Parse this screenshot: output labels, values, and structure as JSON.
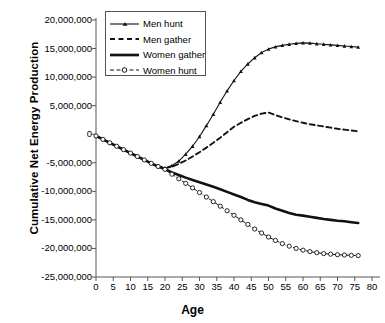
{
  "chart_data": {
    "type": "line",
    "title": "",
    "xlabel": "Age",
    "ylabel": "Cumulative Net Energy Production",
    "xlim": [
      0,
      80
    ],
    "ylim": [
      -25000000,
      20000000
    ],
    "xticks": [
      0,
      5,
      10,
      15,
      20,
      25,
      30,
      35,
      40,
      45,
      50,
      55,
      60,
      65,
      70,
      75,
      80
    ],
    "xtick_labels": [
      "0",
      "5",
      "10",
      "15",
      "20",
      "25",
      "30",
      "35",
      "40",
      "45",
      "50",
      "55",
      "60",
      "65",
      "70",
      "75",
      "80"
    ],
    "yticks": [
      20000000,
      15000000,
      10000000,
      5000000,
      0,
      -5000000,
      -10000000,
      -15000000,
      -20000000,
      -25000000
    ],
    "ytick_labels": [
      "20,000,000",
      "15,000,000",
      "10,000,000",
      "5,000,000",
      "0",
      "-5,000,000",
      "-10,000,000",
      "-15,000,000",
      "-20,000,000",
      "-25,000,000"
    ],
    "grid": false,
    "legend_position": "top-center",
    "x": [
      0,
      2,
      4,
      6,
      8,
      10,
      12,
      14,
      16,
      18,
      20,
      22,
      24,
      26,
      28,
      30,
      32,
      34,
      36,
      38,
      40,
      42,
      44,
      46,
      48,
      50,
      52,
      54,
      56,
      58,
      60,
      62,
      64,
      66,
      68,
      70,
      72,
      74,
      76
    ],
    "series": [
      {
        "name": "Men hunt",
        "marker": "triangle",
        "linestyle": "solid-thin-with-markers",
        "values": [
          -300000,
          -900000,
          -1500000,
          -2100000,
          -2700000,
          -3300000,
          -3900000,
          -4500000,
          -5100000,
          -5600000,
          -5900000,
          -5500000,
          -4700000,
          -3500000,
          -2100000,
          -400000,
          1500000,
          3500000,
          5600000,
          7600000,
          9400000,
          11000000,
          12300000,
          13400000,
          14300000,
          14900000,
          15300000,
          15550000,
          15750000,
          15900000,
          16000000,
          15950000,
          15850000,
          15750000,
          15650000,
          15550000,
          15450000,
          15350000,
          15250000
        ]
      },
      {
        "name": "Men gather",
        "marker": "none",
        "linestyle": "dashed",
        "values": [
          -300000,
          -900000,
          -1500000,
          -2100000,
          -2700000,
          -3300000,
          -3900000,
          -4500000,
          -5100000,
          -5600000,
          -5950000,
          -5700000,
          -5200000,
          -4600000,
          -3900000,
          -3150000,
          -2350000,
          -1500000,
          -600000,
          350000,
          1300000,
          2000000,
          2650000,
          3200000,
          3600000,
          3800000,
          3350000,
          2950000,
          2600000,
          2300000,
          2000000,
          1750000,
          1550000,
          1350000,
          1150000,
          950000,
          800000,
          650000,
          500000
        ]
      },
      {
        "name": "Women gather",
        "marker": "none",
        "linestyle": "solid-thick",
        "values": [
          -300000,
          -900000,
          -1500000,
          -2100000,
          -2700000,
          -3300000,
          -3900000,
          -4500000,
          -5100000,
          -5650000,
          -6100000,
          -6700000,
          -7150000,
          -7600000,
          -8000000,
          -8400000,
          -8800000,
          -9200000,
          -9650000,
          -10100000,
          -10550000,
          -11000000,
          -11500000,
          -11900000,
          -12200000,
          -12500000,
          -13000000,
          -13400000,
          -13800000,
          -14100000,
          -14250000,
          -14450000,
          -14650000,
          -14850000,
          -15000000,
          -15150000,
          -15250000,
          -15400000,
          -15550000
        ]
      },
      {
        "name": "Women hunt",
        "marker": "circle",
        "linestyle": "dash-dot-with-markers",
        "values": [
          -300000,
          -900000,
          -1500000,
          -2100000,
          -2700000,
          -3300000,
          -3900000,
          -4500000,
          -5100000,
          -5650000,
          -6150000,
          -7000000,
          -7800000,
          -8600000,
          -9400000,
          -10200000,
          -11000000,
          -11800000,
          -12600000,
          -13400000,
          -14200000,
          -15000000,
          -15800000,
          -16600000,
          -17300000,
          -18000000,
          -18600000,
          -19150000,
          -19600000,
          -20000000,
          -20300000,
          -20550000,
          -20750000,
          -20900000,
          -21000000,
          -21100000,
          -21150000,
          -21200000,
          -21250000
        ]
      }
    ]
  },
  "legend": {
    "items": [
      {
        "label": "Men hunt"
      },
      {
        "label": "Men gather"
      },
      {
        "label": "Women gather"
      },
      {
        "label": "Women hunt"
      }
    ]
  }
}
